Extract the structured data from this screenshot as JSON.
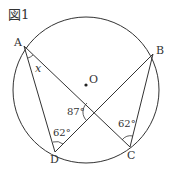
{
  "figure": {
    "label": "図1",
    "circle": {
      "center_label": "O"
    },
    "points": {
      "A": "A",
      "B": "B",
      "C": "C",
      "D": "D"
    },
    "segments": [
      "AD",
      "AC",
      "BD",
      "BC"
    ],
    "angles": {
      "at_A": "x",
      "intersection": "87°",
      "at_D": "62°",
      "at_C": "62°"
    },
    "colors": {
      "stroke": "#333333",
      "background": "#ffffff"
    }
  }
}
